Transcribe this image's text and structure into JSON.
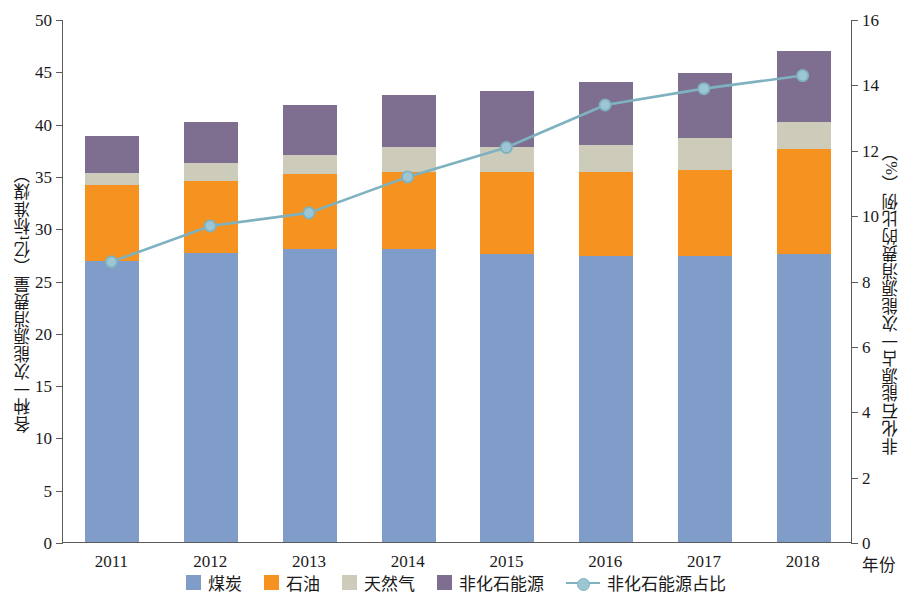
{
  "axes": {
    "y_left_title": "各种一次能源消费量（亿t标准煤）",
    "y_right_title": "非化石能源占一次能源消费的比例（%）",
    "x_title": "年份",
    "y_left_ticks": [
      "0",
      "5",
      "10",
      "15",
      "20",
      "25",
      "30",
      "35",
      "40",
      "45",
      "50"
    ],
    "y_right_ticks": [
      "0",
      "2",
      "4",
      "6",
      "8",
      "10",
      "12",
      "14",
      "16"
    ]
  },
  "legend": {
    "items": [
      {
        "label": "煤炭",
        "color": "#7f9dc8",
        "kind": "swatch"
      },
      {
        "label": "石油",
        "color": "#f59220",
        "kind": "swatch"
      },
      {
        "label": "天然气",
        "color": "#cdcbba",
        "kind": "swatch"
      },
      {
        "label": "非化石能源",
        "color": "#7e6f90",
        "kind": "swatch"
      },
      {
        "label": "非化石能源占比",
        "color": "#7fb2c0",
        "kind": "line"
      }
    ]
  },
  "chart_data": {
    "type": "bar",
    "title": "",
    "xlabel": "年份",
    "ylabel": "各种一次能源消费量（亿t标准煤）",
    "y2label": "非化石能源占一次能源消费的比例（%）",
    "ylim": [
      0,
      50
    ],
    "y2lim": [
      0,
      16
    ],
    "grid": false,
    "legend_position": "bottom",
    "stacked": true,
    "categories": [
      "2011",
      "2012",
      "2013",
      "2014",
      "2015",
      "2016",
      "2017",
      "2018"
    ],
    "series": [
      {
        "name": "煤炭",
        "color": "#7f9dc8",
        "axis": "left",
        "type": "bar",
        "values": [
          26.9,
          27.6,
          28.0,
          28.0,
          27.5,
          27.3,
          27.3,
          27.5
        ]
      },
      {
        "name": "石油",
        "color": "#f59220",
        "axis": "left",
        "type": "bar",
        "values": [
          7.2,
          6.9,
          7.2,
          7.4,
          7.9,
          8.1,
          8.3,
          10.1
        ]
      },
      {
        "name": "天然气",
        "color": "#cdcbba",
        "axis": "left",
        "type": "bar",
        "values": [
          1.2,
          1.7,
          1.8,
          2.4,
          2.4,
          2.6,
          3.0,
          2.6
        ]
      },
      {
        "name": "非化石能源",
        "color": "#7e6f90",
        "axis": "left",
        "type": "bar",
        "values": [
          3.5,
          4.0,
          4.8,
          4.9,
          5.3,
          6.0,
          6.2,
          6.7
        ]
      },
      {
        "name": "非化石能源占比",
        "color": "#7fb2c0",
        "axis": "right",
        "type": "line",
        "values": [
          8.6,
          9.7,
          10.1,
          11.2,
          12.1,
          13.4,
          13.9,
          14.3
        ]
      }
    ],
    "totals": [
      38.8,
      40.2,
      41.8,
      42.7,
      43.1,
      44.0,
      44.8,
      46.9
    ]
  }
}
